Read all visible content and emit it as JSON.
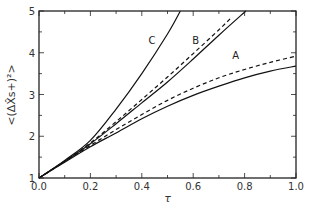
{
  "chart_data": {
    "type": "line",
    "title": "",
    "xlabel": "τ",
    "ylabel": "<(ΔX̂s+)²>",
    "xlim": [
      0,
      1
    ],
    "ylim": [
      1,
      5
    ],
    "grid": false,
    "x_ticks": [
      "0.0",
      "0.2",
      "0.4",
      "0.6",
      "0.8",
      "1.0"
    ],
    "x_tick_values": [
      0,
      0.2,
      0.4,
      0.6,
      0.8,
      1.0
    ],
    "y_ticks": [
      "1",
      "2",
      "3",
      "4",
      "5"
    ],
    "y_tick_values": [
      1,
      2,
      3,
      4,
      5
    ],
    "series": [
      {
        "name": "C",
        "style": "solid",
        "x": [
          0,
          0.1,
          0.2,
          0.3,
          0.4,
          0.5,
          0.55
        ],
        "y": [
          1,
          1.42,
          1.9,
          2.65,
          3.5,
          4.45,
          5.0
        ]
      },
      {
        "name": "B",
        "style": "solid",
        "x": [
          0,
          0.1,
          0.2,
          0.3,
          0.4,
          0.5,
          0.6,
          0.7,
          0.805
        ],
        "y": [
          1,
          1.4,
          1.82,
          2.3,
          2.8,
          3.3,
          3.85,
          4.42,
          5.0
        ]
      },
      {
        "name": "B",
        "style": "dashed",
        "x": [
          0,
          0.1,
          0.2,
          0.3,
          0.4,
          0.5,
          0.6,
          0.7,
          0.75
        ],
        "y": [
          1,
          1.4,
          1.84,
          2.35,
          2.88,
          3.42,
          3.98,
          4.55,
          4.85
        ]
      },
      {
        "name": "A",
        "style": "solid",
        "x": [
          0,
          0.1,
          0.2,
          0.3,
          0.4,
          0.5,
          0.6,
          0.7,
          0.8,
          0.9,
          1.0
        ],
        "y": [
          1,
          1.38,
          1.75,
          2.08,
          2.42,
          2.72,
          2.98,
          3.2,
          3.4,
          3.56,
          3.68
        ]
      },
      {
        "name": "A",
        "style": "dashed",
        "x": [
          0,
          0.1,
          0.2,
          0.3,
          0.4,
          0.5,
          0.6,
          0.7,
          0.8,
          0.9,
          1.0
        ],
        "y": [
          1,
          1.4,
          1.78,
          2.16,
          2.52,
          2.86,
          3.15,
          3.4,
          3.6,
          3.77,
          3.92
        ]
      }
    ],
    "annotations": [
      {
        "text": "C",
        "x": 0.44,
        "y": 4.2
      },
      {
        "text": "B",
        "x": 0.61,
        "y": 4.2
      },
      {
        "text": "A",
        "x": 0.765,
        "y": 3.85
      }
    ]
  }
}
